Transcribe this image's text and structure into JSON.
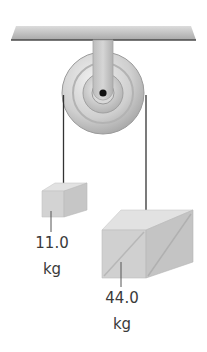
{
  "diagram": {
    "pulley": {
      "center_x": 103,
      "center_y": 93,
      "radius": 41
    },
    "masses": [
      {
        "id": "small",
        "value": "11.0",
        "unit": "kg"
      },
      {
        "id": "large",
        "value": "44.0",
        "unit": "kg"
      }
    ]
  },
  "colors": {
    "ceiling": "#b5b5b5",
    "ceiling_edge": "#4a4a4a",
    "pulley_light": "#e6e6e6",
    "pulley_mid": "#c2c2c2",
    "pulley_dark": "#9a9a9a",
    "string": "#333333",
    "crate_top": "#e2e2e2",
    "crate_front": "#cdcdcd",
    "crate_side": "#bdbdbd",
    "label_text": "#3a3a3a"
  }
}
